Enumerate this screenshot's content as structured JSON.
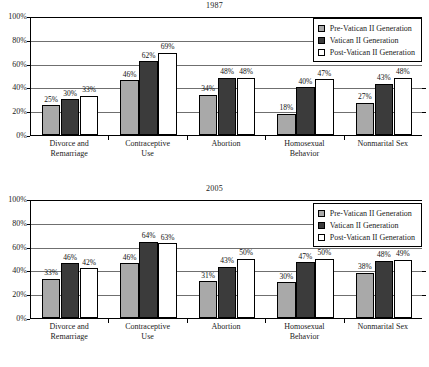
{
  "figure": {
    "series_names": [
      "Pre-Vatican II Generation",
      "Vatican II Generation",
      "Post-Vatican II Generation"
    ],
    "series_colors": [
      "#a9a9a9",
      "#3b3b3b",
      "#ffffff"
    ],
    "y_ticks": [
      "0%",
      "20%",
      "40%",
      "60%",
      "80%",
      "100%"
    ],
    "categories": [
      {
        "line1": "Divorce and",
        "line2": "Remarriage"
      },
      {
        "line1": "Contraceptive",
        "line2": "Use"
      },
      {
        "line1": "Abortion",
        "line2": ""
      },
      {
        "line1": "Homosexual",
        "line2": "Behavior"
      },
      {
        "line1": "Nonmarital Sex",
        "line2": ""
      }
    ]
  },
  "chart_data": [
    {
      "type": "bar",
      "title": "1987",
      "xlabel": "",
      "ylabel": "",
      "ylim": [
        0,
        100
      ],
      "grid": true,
      "legend_position": "top-right",
      "categories": [
        "Divorce and Remarriage",
        "Contraceptive Use",
        "Abortion",
        "Homosexual Behavior",
        "Nonmarital Sex"
      ],
      "tick_labels": [
        "0%",
        "20%",
        "40%",
        "60%",
        "80%",
        "100%"
      ],
      "series": [
        {
          "name": "Pre-Vatican II Generation",
          "values": [
            25,
            46,
            34,
            18,
            27
          ],
          "labels": [
            "25%",
            "46%",
            "34%",
            "18%",
            "27%"
          ]
        },
        {
          "name": "Vatican II Generation",
          "values": [
            30,
            62,
            48,
            40,
            43
          ],
          "labels": [
            "30%",
            "62%",
            "48%",
            "40%",
            "43%"
          ]
        },
        {
          "name": "Post-Vatican II Generation",
          "values": [
            33,
            69,
            48,
            47,
            48
          ],
          "labels": [
            "33%",
            "69%",
            "48%",
            "47%",
            "48%"
          ]
        }
      ]
    },
    {
      "type": "bar",
      "title": "2005",
      "xlabel": "",
      "ylabel": "",
      "ylim": [
        0,
        100
      ],
      "grid": true,
      "legend_position": "top-right",
      "categories": [
        "Divorce and Remarriage",
        "Contraceptive Use",
        "Abortion",
        "Homosexual Behavior",
        "Nonmarital Sex"
      ],
      "tick_labels": [
        "0%",
        "20%",
        "40%",
        "60%",
        "80%",
        "100%"
      ],
      "series": [
        {
          "name": "Pre-Vatican II Generation",
          "values": [
            33,
            46,
            31,
            30,
            38
          ],
          "labels": [
            "33%",
            "46%",
            "31%",
            "30%",
            "38%"
          ]
        },
        {
          "name": "Vatican II Generation",
          "values": [
            46,
            64,
            43,
            47,
            48
          ],
          "labels": [
            "46%",
            "64%",
            "43%",
            "47%",
            "48%"
          ]
        },
        {
          "name": "Post-Vatican II Generation",
          "values": [
            42,
            63,
            50,
            50,
            49
          ],
          "labels": [
            "42%",
            "63%",
            "50%",
            "50%",
            "49%"
          ]
        }
      ]
    }
  ]
}
